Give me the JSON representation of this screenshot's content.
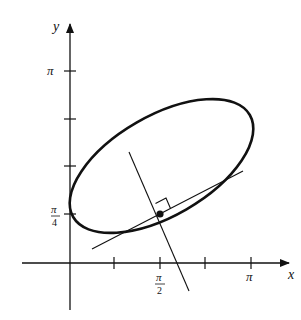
{
  "diagram": {
    "axes": {
      "x_label": "x",
      "y_label": "y",
      "x_ticks": [
        {
          "pos": 114,
          "label": ""
        },
        {
          "pos": 160,
          "label_num": "π",
          "label_den": "2"
        },
        {
          "pos": 205,
          "label": ""
        },
        {
          "pos": 251,
          "label": "π"
        }
      ],
      "y_ticks": [
        {
          "pos": 71,
          "label": "π"
        },
        {
          "pos": 119,
          "label": ""
        },
        {
          "pos": 166,
          "label": ""
        },
        {
          "pos": 214,
          "label_num": "π",
          "label_den": "4"
        }
      ]
    },
    "labels": {
      "x": "x",
      "y": "y",
      "pi": "π",
      "pi_x": "π",
      "two": "2",
      "four": "4"
    },
    "elements": [
      "ellipse curve",
      "tangent line",
      "normal line",
      "right-angle marker",
      "point of tangency"
    ],
    "colors": {
      "stroke": "#111111",
      "background": "#ffffff"
    }
  }
}
